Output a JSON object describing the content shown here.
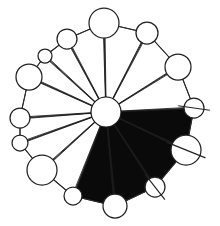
{
  "figure": {
    "width": 220,
    "height": 226,
    "background_color": "#ffffff",
    "line_color": "#222222",
    "fill_light_color": "#ffffff",
    "fill_dark_color": "#0a0a0a"
  },
  "chart_data": {
    "type": "pie",
    "subtitle": "",
    "xlabel": "",
    "ylabel": "",
    "legend_position": "none",
    "grid": false,
    "center": {
      "x": 106,
      "y": 112
    },
    "hub_radius": 15,
    "sector_count": 14,
    "categories": [
      "S1",
      "S2",
      "S3",
      "S4",
      "S5",
      "S6",
      "S7",
      "S8",
      "S9",
      "S10",
      "S11",
      "S12",
      "S13",
      "S14"
    ],
    "values": [
      80,
      72,
      86,
      74,
      90,
      80,
      70,
      84,
      96,
      78,
      88,
      82,
      70,
      76
    ],
    "fills": [
      "dark",
      "dark",
      "dark",
      "dark",
      "light",
      "light",
      "light",
      "light",
      "light",
      "light",
      "light",
      "light",
      "light",
      "light"
    ],
    "vertices": [
      {
        "name": "v-right",
        "x": 194,
        "y": 108,
        "radius": 10,
        "slash": true,
        "slash_angle": 8
      },
      {
        "name": "v-right-lower",
        "x": 186,
        "y": 150,
        "radius": 15,
        "slash": true,
        "slash_angle": 22
      },
      {
        "name": "v-lower-right",
        "x": 155,
        "y": 187,
        "radius": 10,
        "slash": true,
        "slash_angle": 52
      },
      {
        "name": "v-bottom",
        "x": 115,
        "y": 206,
        "radius": 12,
        "slash": false,
        "slash_angle": 0
      },
      {
        "name": "v-bottom-left",
        "x": 73,
        "y": 196,
        "radius": 9,
        "slash": false,
        "slash_angle": 0
      },
      {
        "name": "v-lower-left",
        "x": 42,
        "y": 170,
        "radius": 15,
        "slash": false,
        "slash_angle": 0
      },
      {
        "name": "v-left-lower",
        "x": 20,
        "y": 143,
        "radius": 8,
        "slash": false,
        "slash_angle": 0
      },
      {
        "name": "v-left",
        "x": 20,
        "y": 118,
        "radius": 10,
        "slash": false,
        "slash_angle": 0
      },
      {
        "name": "v-left-upper",
        "x": 29,
        "y": 77,
        "radius": 13,
        "slash": false,
        "slash_angle": 0
      },
      {
        "name": "v-upper-left",
        "x": 45,
        "y": 56,
        "radius": 7,
        "slash": false,
        "slash_angle": 0
      },
      {
        "name": "v-upper-left-outer",
        "x": 67,
        "y": 39,
        "radius": 10,
        "slash": false,
        "slash_angle": 0
      },
      {
        "name": "v-top",
        "x": 104,
        "y": 23,
        "radius": 15,
        "slash": false,
        "slash_angle": 0
      },
      {
        "name": "v-top-right",
        "x": 147,
        "y": 33,
        "radius": 11,
        "slash": false,
        "slash_angle": 0
      },
      {
        "name": "v-upper-right",
        "x": 178,
        "y": 67,
        "radius": 13,
        "slash": false,
        "slash_angle": 0
      }
    ],
    "annotations": []
  }
}
